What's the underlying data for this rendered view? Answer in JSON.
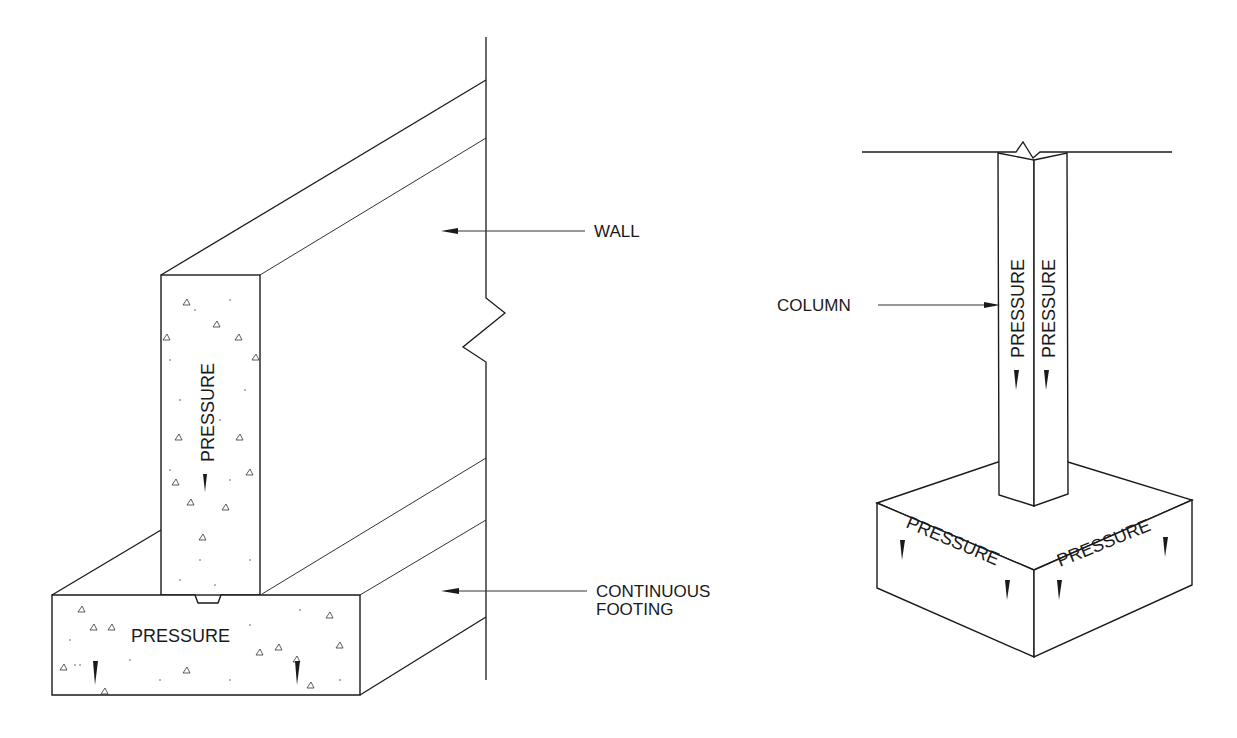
{
  "diagram": {
    "left_figure": {
      "name": "wall-on-continuous-footing",
      "labels": {
        "wall": "WALL",
        "footing_line1": "CONTINUOUS",
        "footing_line2": "FOOTING"
      },
      "pressure_labels": {
        "wall_face": "PRESSURE",
        "footing_face": "PRESSURE"
      }
    },
    "right_figure": {
      "name": "column-on-spread-footing",
      "labels": {
        "column": "COLUMN"
      },
      "pressure_labels": {
        "column_left": "PRESSURE",
        "column_right": "PRESSURE",
        "footing_left": "PRESSURE",
        "footing_right": "PRESSURE"
      }
    },
    "colors": {
      "line": "#1a1a1a",
      "background": "#ffffff"
    }
  }
}
